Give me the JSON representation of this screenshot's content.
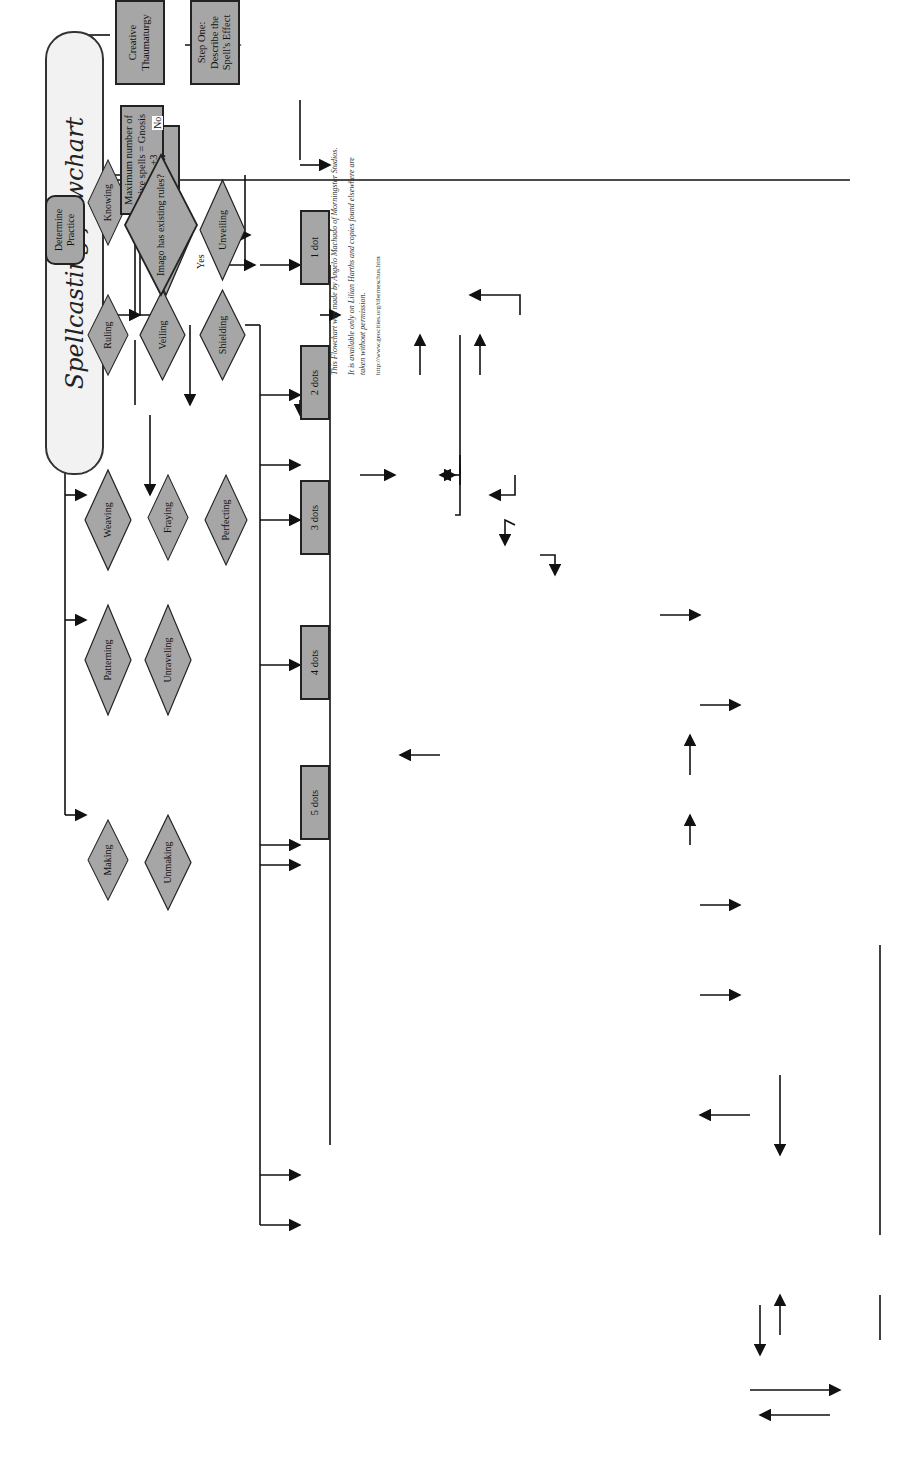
{
  "title": "Spellcasting flowchart",
  "credit": {
    "line1": "This Flowchart was made by Angelo Machado of Morningstar Studios.",
    "line2": "It is available only on Lilian Harths and copies found elsewhere are taken without permission.",
    "url": "http://www.geocities.org/tiberneschus.htm"
  },
  "colors": {
    "dark_node": "#a6a6a6",
    "light_node": "#e4e4e4",
    "border": "#222222"
  },
  "practices": {
    "determine": "Determine Practice",
    "row1": [
      "Knowing",
      "Compelling",
      "Unveiling"
    ],
    "row2": [
      "Ruling",
      "Veiling",
      "Shielding"
    ],
    "row3": [
      "Weaving",
      "Fraying",
      "Perfecting"
    ],
    "row4": [
      "Patterning",
      "Unraveling"
    ],
    "row5": [
      "Making",
      "Unmaking"
    ],
    "dots": [
      "1 dot",
      "2 dots",
      "3 dots",
      "4 dots",
      "5 dots"
    ]
  },
  "step_one": {
    "label": "Step One: Declare the Spell",
    "max_spells": "Maximum number of active spells = Gnosis +3",
    "imago_q": "Imago has existing rules?",
    "no": "No",
    "yes": "Yes",
    "creative": "Creative Thaumaturgy",
    "describe": "Step One: Describe the Spell's Effect",
    "arcana": "Step Two: Determine the Arcanum used",
    "dot_req": "Step Three: Determine dot requirement",
    "determine_features": "Determine spell features",
    "mana_costs": "Check Mana Costs: Base cost + 1 for sympathetic, +1 for non ruling improvised, +1 per aggravated Damage. Mana expenditure in a turn = Gnosis",
    "action_q": "Action",
    "extended": "extended",
    "instant": "instant",
    "resolved_rolls": "resolved over a number of rolls",
    "resolved_turn": "resolved in 1 turn",
    "gnosis_times": "Gnosis 1-2: 3 hours per roll, Gnosis 3-4: 1 hour per roll, Gnosis 5-6: 30 minutes per roll, Gnosis 7-8: 10 minutes per roll, Gnosis 9-10: 1 minute per roll",
    "duration": "Duration: Lasting (permanent), Concentration (as long as Mage focuses on spell), Transitory (one turn), prolonged (one scene)",
    "aspect": "Aspect: Covert (not obviously supernatural), Vulgar (blatantly supernatural)"
  },
  "range": {
    "touch_q": "touch range?",
    "sensory_q": "sensory range?",
    "yes": "yes",
    "no": "no",
    "plus_sensory": "+1 dot for sensory, +2 for sympathetic",
    "plus_sympathetic": "+1 dot for sympathetic",
    "complex_q": "Complex version of practice?",
    "plus_one": "+1 dot"
  },
  "step_two": {
    "label": "Step Two: Spellcasting Dice Pool",
    "rote_q": "Is the spell cast a rote",
    "yes": "yes",
    "no": "no",
    "pool_gnosis": "Dice pool = Gnosis + Arcanum",
    "pool_attr": "Dice pool = Attribute + Skill + Arcanum",
    "high_speech": "High speech: +2 to pool, 1 turn for instant, 30 mins for extended",
    "range_q": "What is the Range?",
    "touch": "touch",
    "sensory": "sensory",
    "sympathetic": "sympathetic",
    "grapple": "Grapple rules may apply",
    "grappled": "If Grappled and Vulgar: -1 if restrained -2 if immobilized cannot use magical Tools",
    "fame": "-1 per dot of Fame or Occultation target has",
    "true_name": "If True Name not known, increase Sympathy Penalty by two degrees",
    "stamina": "For every spell on Mage above her Stamina, -1 to spellcasting pool",
    "space": "Requires Space 2, and 1 level higher in Arcanum",
    "sympathy": "Sympathy Penalties: Sensory: 0; Intimate -2; Known -4; Acquainted -6; Encountered -8; Described -10 Cannot target if Unknown"
  },
  "resistance": {
    "q": "Magical Resistance?",
    "contested": "contested",
    "automated": "automated",
    "aimed": "aimed",
    "counter": "counter magic",
    "r1": "target uses Resistance Attribute + Power Stat",
    "r2": "subtract Resistance Attribute",
    "r3": "subtract defense",
    "r4": "Dispel Magic Spell; Magic Shields; Counterspell"
  },
  "step_three": {
    "label": "Step Three: Spell Factors",
    "default": "Default: Potency = 1; Target = 1, Size 20, 1 yd vol or 5 sq yrs; Duration = 1 turn (transitory) or one hour/scene (prolonged)",
    "increasing": "Increasing Spell Factors",
    "advanced": "Advanced Factors; requires +1 Arcanum",
    "potency": "Potency: Instant = -2 per extra point; Extended = +1 success per extra point",
    "targets": "Number of Targets: Instant = -2 per x2 targets; Extended = +1 success per x2 targets",
    "largest": "Size of Largest Target: Instant = -2 per +10 Size; Extended = +1 success per +10 Size",
    "area1": "Size of Area: Instant = -2 per x2 extra radius or volume; Extended = +1 success per x2 extra radius or volume",
    "area2": "Size of Area: Instant = -2 per x4 extra radius or volume; Extended = +1 success per x4 extra radius or volume",
    "transitory": "Transitory Duration: 1, 2, 3, 5, 10; -2 or +1 for each step and then again per +10 turns",
    "prolonged1": "Prolonged Duration: 1 hour, 2 hours, 12 hours, 1 day, 2 days; -2 or +1 for each step and then again per +2 days",
    "prolonged2": "Prolonged Duration: 1 hour, 24 hours, 2 days, 1 week, 1 Month, indefinite; -2 or +1 for each step and then again per +2 days",
    "conditional": "Conditional Duration; Fate 2 Improbable +1 Infrequent +2 Common +3",
    "runes": "Atlantean Runes: +1 duration - must be drawn within day of performing spell"
  },
  "step_four": {
    "label": "Step Four: Paradox",
    "vulgar_q": "Is spell Vulgar?",
    "improbable_q": "Is spell improbable ?",
    "yes": "yes",
    "no": "no",
    "base_pool": "Base Paradox Dice Pool: Gnosis 1-2 = 1 Gnosis 3-4 = 2 Gnosis 5-6 = 3 Gnosis 7-8 = 4 Gnosis 9-10 = 5",
    "modifiers": "Pool Modifiers: +1 Accumulative, each paradox roll after first. -1 Using a rote -1 Uses a Magical Tool +2 Sleeper witnesses Vulgar",
    "mitigation": "Paradox Mitigation: -1 per Mana spent (cannot exceed Mana expenditure including spell costs)",
    "roll": "roll dice",
    "success": "success",
    "failure": "failure",
    "num_success": "Number of Success: 1 = Havoc 2 = Bedlam 3 = Anomaly 4 = Branding 5 = Manifestation",
    "backlash": "Each success reduces Spellcasting dice pool by 1 May take successes as backlash"
  },
  "step_five": {
    "label": "Step Five: Casting Spell",
    "q": "Instant or Extended?",
    "instant": "instant",
    "extended": "extended",
    "dramatic": "dramatic failure",
    "failure": "failure",
    "success": "success",
    "exceptional": "exceptional success",
    "i1": "Spell fails, paradox is more severe",
    "i2": "Spell fails",
    "i3": "Spell takes place as imagined",
    "i4": "Spell takes place better then imagined",
    "e1": "Accumulated Successes are lost",
    "e2": "No progress made",
    "e3": "Successes accumulated",
    "e4": "+5 successes, spell assumes ideal form"
  }
}
